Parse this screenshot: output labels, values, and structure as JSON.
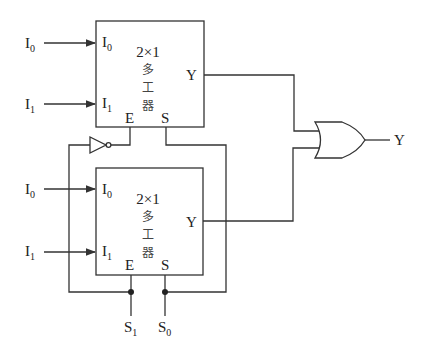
{
  "diagram": {
    "type": "4x1 multiplexer built from two 2x1 multiplexers and OR gate",
    "mux_top": {
      "title": "2×1",
      "name_chars": [
        "多",
        "工",
        "器"
      ],
      "inputs": [
        {
          "pin": "I",
          "sub": "0"
        },
        {
          "pin": "I",
          "sub": "1"
        }
      ],
      "enable": "E",
      "select": "S",
      "output": "Y"
    },
    "mux_bottom": {
      "title": "2×1",
      "name_chars": [
        "多",
        "工",
        "器"
      ],
      "inputs": [
        {
          "pin": "I",
          "sub": "0"
        },
        {
          "pin": "I",
          "sub": "1"
        }
      ],
      "enable": "E",
      "select": "S",
      "output": "Y"
    },
    "external_inputs_top": [
      {
        "name": "I",
        "sub": "0"
      },
      {
        "name": "I",
        "sub": "1"
      }
    ],
    "external_inputs_bottom": [
      {
        "name": "I",
        "sub": "0"
      },
      {
        "name": "I",
        "sub": "1"
      }
    ],
    "select_lines": [
      {
        "name": "S",
        "sub": "1"
      },
      {
        "name": "S",
        "sub": "0"
      }
    ],
    "gates": {
      "inverter": "NOT",
      "combiner": "OR"
    },
    "final_output": "Y"
  }
}
